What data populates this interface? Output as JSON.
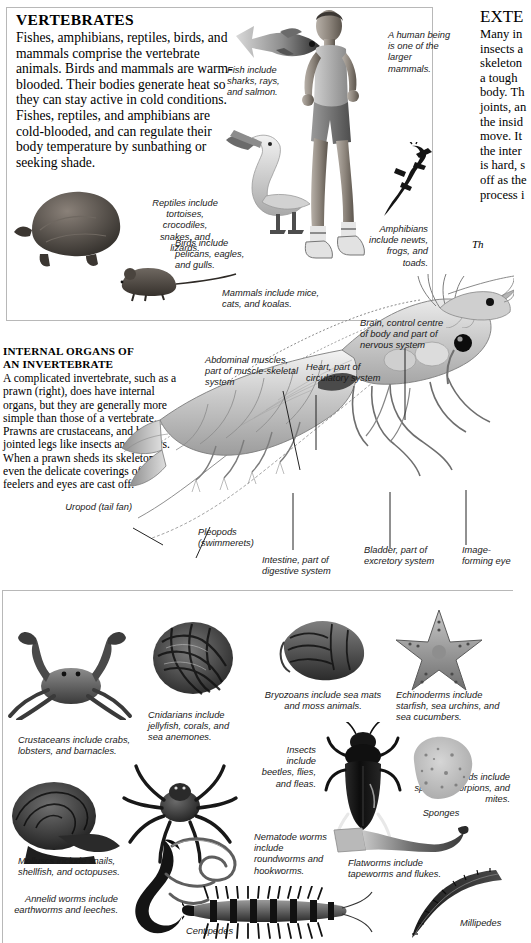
{
  "page": {
    "width": 514,
    "height": 940,
    "background": "#ffffff",
    "ink": "#000000"
  },
  "vertebrates_panel": {
    "title": "VERTEBRATES",
    "body": "Fishes, amphibians, reptiles, birds, and mammals comprise the vertebrate animals. Birds and mammals are warm-blooded. Their bodies generate heat so they can stay active in cold conditions. Fishes, reptiles, and amphibians are cold-blooded, and can regulate their body temperature by sunbathing or seeking shade.",
    "captions": [
      {
        "id": "fish",
        "text": "Fish include sharks, rays, and salmon."
      },
      {
        "id": "human",
        "text": "A human being is one of the larger mammals."
      },
      {
        "id": "reptiles",
        "text": "Reptiles include tortoises, crocodiles, snakes, and lizards."
      },
      {
        "id": "birds",
        "text": "Birds include pelicans, eagles, and gulls."
      },
      {
        "id": "amphibians",
        "text": "Amphibians include newts, frogs, and toads."
      },
      {
        "id": "mammals",
        "text": "Mammals include mice, cats, and koalas."
      }
    ]
  },
  "internal_organs": {
    "title_line1": "INTERNAL ORGANS OF",
    "title_line2": "AN INVERTEBRATE",
    "body": "A complicated invertebrate, such as a prawn (right), does have internal organs, but they are generally more simple than those of a vertebrate. Prawns are crustaceans, and have jointed legs like insects and spiders. When a prawn sheds its skeleton, even the delicate coverings of its feelers and eyes are cast off.",
    "labels": [
      {
        "id": "uropod",
        "text": "Uropod (tail fan)"
      },
      {
        "id": "abdominal-muscles",
        "text": "Abdominal muscles, part of muscle-skeletal system"
      },
      {
        "id": "heart",
        "text": "Heart, part of circulatory system"
      },
      {
        "id": "brain",
        "text": "Brain, control centre of body and part of nervous system"
      },
      {
        "id": "pleopods",
        "text": "Pleopods (swimmerets)"
      },
      {
        "id": "intestine",
        "text": "Intestine, part of digestive system"
      },
      {
        "id": "bladder",
        "text": "Bladder, part of excretory system"
      },
      {
        "id": "eye",
        "text": "Image-forming eye"
      }
    ]
  },
  "exoskeleton_column": {
    "title": "EXTE",
    "lines": [
      "Many in",
      "insects a",
      "skeleton",
      "a tough",
      "body. Th",
      "joints, an",
      "the insid",
      "move. It",
      "the inter",
      "is hard, s",
      "off as the",
      "process i"
    ],
    "fragment_italic": "Th",
    "fragment_lines": [
      "une",
      "is t"
    ]
  },
  "invertebrates_panel": {
    "captions": [
      {
        "id": "crustaceans",
        "text": "Crustaceans include crabs, lobsters, and barnacles."
      },
      {
        "id": "cnidarians",
        "text": "Cnidarians include jellyfish, corals, and sea anemones."
      },
      {
        "id": "bryozoans",
        "text": "Bryozoans include sea mats and moss animals."
      },
      {
        "id": "echinoderms",
        "text": "Echinoderms include starfish, sea urchins, and sea cucumbers."
      },
      {
        "id": "arachnids",
        "text": "Arachnids include spiders, scorpions, and mites."
      },
      {
        "id": "insects",
        "text": "Insects include beetles, flies, and fleas."
      },
      {
        "id": "sponges",
        "text": "Sponges"
      },
      {
        "id": "molluscs",
        "text": "Molluscs include snails, shellfish, and octopuses."
      },
      {
        "id": "nematodes",
        "text": "Nematode worms include roundworms and hookworms."
      },
      {
        "id": "flatworms",
        "text": "Flatworms include tapeworms and flukes."
      },
      {
        "id": "annelids",
        "text": "Annelid worms include earthworms and leeches."
      },
      {
        "id": "centipedes",
        "text": "Centipedes"
      },
      {
        "id": "millipedes",
        "text": "Millipedes"
      }
    ]
  }
}
